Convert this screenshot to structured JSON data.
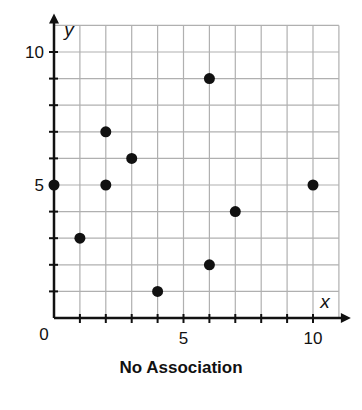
{
  "chart_data": {
    "type": "scatter",
    "title": "No Association",
    "xlabel": "x",
    "ylabel": "y",
    "xlim": [
      0,
      11
    ],
    "ylim": [
      0,
      11
    ],
    "grid": true,
    "x_ticks": [
      0,
      5,
      10
    ],
    "y_ticks": [
      5,
      10
    ],
    "origin_label": "0",
    "points": [
      {
        "x": 0,
        "y": 5
      },
      {
        "x": 1,
        "y": 3
      },
      {
        "x": 2,
        "y": 7
      },
      {
        "x": 2,
        "y": 5
      },
      {
        "x": 3,
        "y": 6
      },
      {
        "x": 4,
        "y": 1
      },
      {
        "x": 6,
        "y": 9
      },
      {
        "x": 6,
        "y": 2
      },
      {
        "x": 7,
        "y": 4
      },
      {
        "x": 10,
        "y": 5
      }
    ],
    "colors": {
      "points": "#111111",
      "grid": "#b0b0b0",
      "axes": "#111111"
    }
  }
}
